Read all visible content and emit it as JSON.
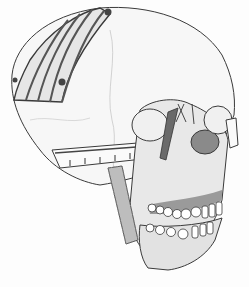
{
  "illustration": {
    "subject": "skull-with-cranial-bone-graft-and-fixation",
    "style": "pencil line drawing",
    "colors": {
      "background": "#fdfdfd",
      "line": "#3a3a3a",
      "bone_fill": "#efefef",
      "shade": "#9a9a9a",
      "dark_shade": "#6a6a6a",
      "graft_fill": "#e6e6e6",
      "teeth": "#ffffff"
    },
    "graft_strips": 5
  }
}
